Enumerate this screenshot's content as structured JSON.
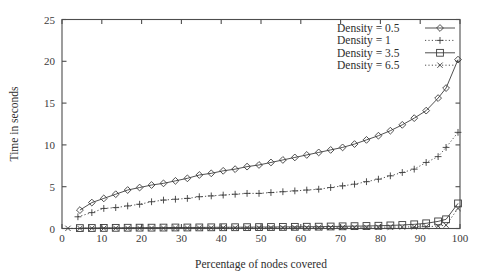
{
  "chart_data": {
    "type": "line",
    "title": "",
    "xlabel": "Percentage of nodes covered",
    "ylabel": "Time in seconds",
    "xlim": [
      0,
      100
    ],
    "ylim": [
      0,
      25
    ],
    "xticks": [
      0,
      10,
      20,
      30,
      40,
      50,
      60,
      70,
      80,
      90,
      100
    ],
    "yticks": [
      0,
      5,
      10,
      15,
      20,
      25
    ],
    "grid": false,
    "legend_position": "top-right",
    "series": [
      {
        "name": "Density = 0.5",
        "marker": "diamond",
        "linestyle": "solid",
        "x": [
          4.5,
          7.5,
          10.5,
          13.5,
          16.5,
          19.5,
          22.5,
          25.5,
          28.5,
          31.5,
          34.5,
          37.5,
          40.5,
          43.5,
          46.5,
          49.5,
          52.5,
          55.5,
          58.5,
          61.5,
          64.5,
          67.5,
          70.5,
          73.5,
          76.5,
          79.5,
          82.5,
          85.5,
          88.5,
          91.5,
          94.5,
          96.5,
          99.5
        ],
        "y": [
          2.2,
          3.1,
          3.6,
          4.1,
          4.6,
          4.9,
          5.2,
          5.4,
          5.7,
          6.0,
          6.4,
          6.6,
          6.9,
          7.1,
          7.4,
          7.6,
          7.9,
          8.2,
          8.5,
          8.8,
          9.1,
          9.4,
          9.7,
          10.1,
          10.6,
          11.1,
          11.7,
          12.4,
          13.2,
          14.1,
          15.6,
          16.8,
          20.2
        ]
      },
      {
        "name": "Density = 1",
        "marker": "plus",
        "linestyle": "dotted",
        "x": [
          4.0,
          7.5,
          10.5,
          13.5,
          16.5,
          19.5,
          22.5,
          25.5,
          28.5,
          31.5,
          34.5,
          37.5,
          40.5,
          43.5,
          46.5,
          49.5,
          52.5,
          55.5,
          58.5,
          61.5,
          64.5,
          67.5,
          70.5,
          73.5,
          76.5,
          79.5,
          82.5,
          85.5,
          88.5,
          91.5,
          94.5,
          96.5,
          99.5
        ],
        "y": [
          1.4,
          1.9,
          2.4,
          2.5,
          2.7,
          2.9,
          3.2,
          3.4,
          3.5,
          3.6,
          3.8,
          3.9,
          4.0,
          4.1,
          4.2,
          4.2,
          4.3,
          4.4,
          4.5,
          4.6,
          4.7,
          4.9,
          5.1,
          5.3,
          5.6,
          5.9,
          6.3,
          6.7,
          7.1,
          7.9,
          8.6,
          9.7,
          11.5
        ]
      },
      {
        "name": "Density = 3.5",
        "marker": "square",
        "linestyle": "solid",
        "x": [
          4.5,
          7.5,
          10.5,
          13.5,
          16.5,
          19.5,
          22.5,
          25.5,
          28.5,
          31.5,
          34.5,
          37.5,
          40.5,
          43.5,
          46.5,
          49.5,
          52.5,
          55.5,
          58.5,
          61.5,
          64.5,
          67.5,
          70.5,
          73.5,
          76.5,
          79.5,
          82.5,
          85.5,
          88.5,
          91.5,
          94.5,
          96.5,
          99.5
        ],
        "y": [
          0.05,
          0.06,
          0.07,
          0.08,
          0.09,
          0.1,
          0.1,
          0.11,
          0.12,
          0.12,
          0.13,
          0.14,
          0.15,
          0.15,
          0.16,
          0.17,
          0.18,
          0.19,
          0.2,
          0.21,
          0.22,
          0.24,
          0.26,
          0.28,
          0.3,
          0.33,
          0.37,
          0.42,
          0.5,
          0.62,
          0.85,
          1.1,
          3.0
        ]
      },
      {
        "name": "Density = 6.5",
        "marker": "cross",
        "linestyle": "dotted",
        "x": [
          1.5,
          4.5,
          7.5,
          10.5,
          13.5,
          16.5,
          19.5,
          22.5,
          25.5,
          28.5,
          31.5,
          34.5,
          37.5,
          40.5,
          43.5,
          46.5,
          49.5,
          52.5,
          55.5,
          58.5,
          61.5,
          64.5,
          67.5,
          70.5,
          73.5,
          76.5,
          79.5,
          82.5,
          85.5,
          88.5,
          91.5,
          94.5,
          96.5,
          99.5
        ],
        "y": [
          0.02,
          0.02,
          0.03,
          0.03,
          0.04,
          0.04,
          0.05,
          0.05,
          0.05,
          0.06,
          0.06,
          0.07,
          0.07,
          0.08,
          0.08,
          0.09,
          0.09,
          0.1,
          0.1,
          0.11,
          0.11,
          0.12,
          0.13,
          0.13,
          0.14,
          0.15,
          0.16,
          0.17,
          0.18,
          0.2,
          0.22,
          0.28,
          0.4,
          2.4
        ]
      }
    ]
  },
  "axes": {
    "x_title": "Percentage of nodes covered",
    "y_title": "Time in seconds",
    "x_tick_labels": [
      "0",
      "10",
      "20",
      "30",
      "40",
      "50",
      "60",
      "70",
      "80",
      "90",
      "100"
    ],
    "y_tick_labels": [
      "0",
      "5",
      "10",
      "15",
      "20",
      "25"
    ]
  },
  "legend": {
    "entries": [
      {
        "label": "Density = 0.5"
      },
      {
        "label": "Density = 1"
      },
      {
        "label": "Density = 3.5"
      },
      {
        "label": "Density = 6.5"
      }
    ]
  },
  "colors": {
    "ink": "#3c3c3c",
    "axis": "#4d4d4d",
    "background": "#ffffff"
  }
}
